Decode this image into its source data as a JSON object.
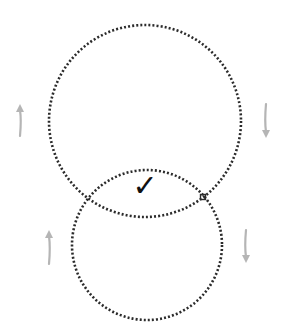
{
  "diagram": {
    "type": "two overlapping dotted circles with rotation arrows",
    "colors": {
      "background": "#ffffff",
      "circle_dots": "#2b2b2b",
      "arrows": "#b5b5b5",
      "checkmark": "#111111"
    },
    "circles": [
      {
        "name": "upper-circle",
        "cx": 145,
        "cy": 121,
        "r": 96
      },
      {
        "name": "lower-circle",
        "cx": 147,
        "cy": 245,
        "r": 75
      }
    ],
    "arrows": [
      {
        "name": "upper-left-arrow",
        "direction": "up",
        "x": 20,
        "y1": 136,
        "y2": 104
      },
      {
        "name": "upper-right-arrow",
        "direction": "down",
        "x": 266,
        "y1": 104,
        "y2": 138
      },
      {
        "name": "lower-left-arrow",
        "direction": "up",
        "x": 49,
        "y1": 264,
        "y2": 230
      },
      {
        "name": "lower-right-arrow",
        "direction": "down",
        "x": 246,
        "y1": 230,
        "y2": 263
      }
    ],
    "checkmark": {
      "symbol": "✓",
      "x": 145,
      "y": 196
    },
    "intersection_marker": {
      "x": 203,
      "y": 197
    }
  }
}
